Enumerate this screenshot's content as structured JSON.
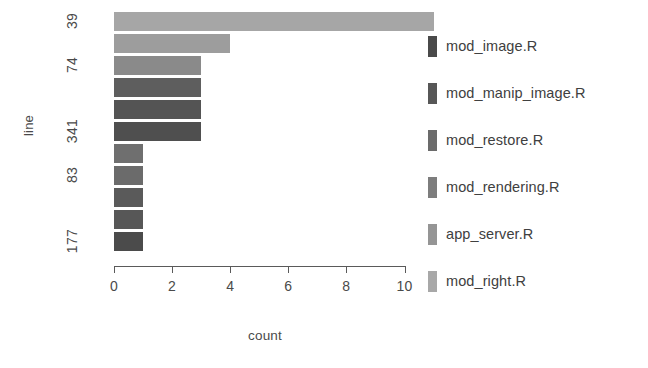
{
  "chart_data": {
    "type": "bar",
    "orientation": "horizontal",
    "title": "",
    "xlabel": "count",
    "ylabel": "line",
    "xlim": [
      0,
      11.4
    ],
    "x_ticks": [
      "0",
      "2",
      "4",
      "6",
      "8",
      "10"
    ],
    "x_tick_values": [
      0,
      2,
      4,
      6,
      8,
      10
    ],
    "grid": false,
    "legend_position": "right",
    "categories": [
      "39",
      "",
      "74",
      "",
      "",
      "341",
      "",
      "83",
      "",
      "",
      "177"
    ],
    "y_tick_labels": [
      "39",
      "74",
      "341",
      "83",
      "177"
    ],
    "y_tick_bar_index": [
      0,
      2,
      5,
      7,
      10
    ],
    "values": [
      11,
      4,
      3,
      3,
      3,
      3,
      1,
      1,
      1,
      1,
      1
    ],
    "bar_colors": [
      "#a6a6a6",
      "#9d9d9d",
      "#8a8a8a",
      "#5e5e5e",
      "#545454",
      "#4f4f4f",
      "#6f6f6f",
      "#6b6b6b",
      "#5a5a5a",
      "#575757",
      "#4b4b4b"
    ],
    "bars": [
      {
        "label": "39",
        "value": 11,
        "color": "#a6a6a6"
      },
      {
        "label": "",
        "value": 4,
        "color": "#9d9d9d"
      },
      {
        "label": "74",
        "value": 3,
        "color": "#8a8a8a"
      },
      {
        "label": "",
        "value": 3,
        "color": "#5e5e5e"
      },
      {
        "label": "",
        "value": 3,
        "color": "#545454"
      },
      {
        "label": "341",
        "value": 3,
        "color": "#4f4f4f"
      },
      {
        "label": "",
        "value": 1,
        "color": "#6f6f6f"
      },
      {
        "label": "83",
        "value": 1,
        "color": "#6b6b6b"
      },
      {
        "label": "",
        "value": 1,
        "color": "#5a5a5a"
      },
      {
        "label": "",
        "value": 1,
        "color": "#575757"
      },
      {
        "label": "177",
        "value": 1,
        "color": "#4b4b4b"
      }
    ],
    "legend": {
      "title": "",
      "entries": [
        {
          "label": "mod_image.R",
          "color": "#4a4a4a"
        },
        {
          "label": "mod_manip_image.R",
          "color": "#575757"
        },
        {
          "label": "mod_restore.R",
          "color": "#6b6b6b"
        },
        {
          "label": "mod_rendering.R",
          "color": "#7d7d7d"
        },
        {
          "label": "app_server.R",
          "color": "#959595"
        },
        {
          "label": "mod_right.R",
          "color": "#a8a8a8"
        }
      ]
    }
  },
  "axes": {
    "x_axis_label": "count",
    "y_axis_label": "line"
  }
}
